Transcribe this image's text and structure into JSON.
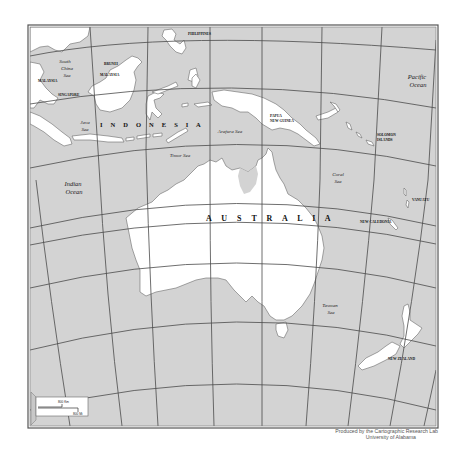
{
  "map": {
    "title": "Australia and surrounding region",
    "colors": {
      "sea": "#d3d3d3",
      "land": "#ffffff",
      "graticule": "#4a4a4a",
      "frame": "#555555"
    },
    "labels": {
      "australia": "A U S T R A L I A",
      "indonesia": "I N D O N E S I A",
      "philippines": "PHILIPPINES",
      "brunei": "BRUNEI",
      "malaysia_east": "MALAYSIA",
      "malaysia_west": "MALAYSIA",
      "singapore": "SINGAPORE",
      "papua_new_guinea_1": "PAPUA",
      "papua_new_guinea_2": "NEW GUINEA",
      "solomon_islands_1": "SOLOMON",
      "solomon_islands_2": "ISLANDS",
      "vanuatu": "VANUATU",
      "new_caledonia": "NEW CALEDONIA",
      "new_zealand": "NEW ZEALAND",
      "south_china_sea_1": "South",
      "south_china_sea_2": "China",
      "south_china_sea_3": "Sea",
      "java_sea_1": "Java",
      "java_sea_2": "Sea",
      "arafura_sea": "Arafura Sea",
      "timor_sea": "Timor Sea",
      "coral_sea_1": "Coral",
      "coral_sea_2": "Sea",
      "tasman_sea_1": "Tasman",
      "tasman_sea_2": "Sea",
      "indian_ocean_1": "Indian",
      "indian_ocean_2": "Ocean",
      "pacific_ocean_1": "Pacific",
      "pacific_ocean_2": "Ocean"
    },
    "scale_bar": {
      "km_label": "800 Km",
      "mi_label": "800 Mi"
    }
  },
  "credit": {
    "line1": "Produced by the Cartographic Research Lab",
    "line2": "University of Alabama"
  }
}
